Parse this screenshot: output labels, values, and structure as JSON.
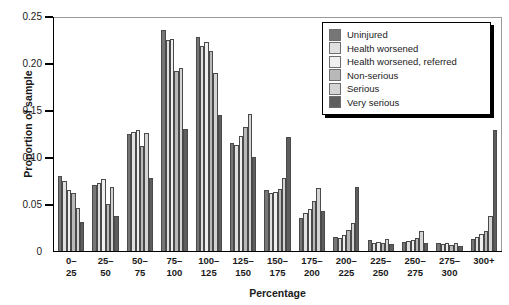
{
  "chart_data": {
    "type": "bar",
    "title": "",
    "xlabel": "Percentage",
    "ylabel": "Proportion of sample",
    "ylim": [
      0,
      0.25
    ],
    "ytick_values": [
      0,
      0.05,
      0.1,
      0.15,
      0.2,
      0.25
    ],
    "ytick_labels": [
      "0",
      "0.05",
      "0.10",
      "0.15",
      "0.20",
      "0.25"
    ],
    "grid": false,
    "legend_position": "top-right",
    "categories": [
      "0–25",
      "25–50",
      "50–75",
      "75–100",
      "100–125",
      "125–150",
      "150–175",
      "175–200",
      "200–225",
      "225–250",
      "250–275",
      "275–300",
      "300+"
    ],
    "category_lines": [
      [
        "0–",
        "25"
      ],
      [
        "25–",
        "50"
      ],
      [
        "50–",
        "75"
      ],
      [
        "75–",
        "100"
      ],
      [
        "100–",
        "125"
      ],
      [
        "125–",
        "150"
      ],
      [
        "150–",
        "175"
      ],
      [
        "175–",
        "200"
      ],
      [
        "200–",
        "225"
      ],
      [
        "225–",
        "250"
      ],
      [
        "250–",
        "275"
      ],
      [
        "275–",
        "300"
      ],
      [
        "300+",
        ""
      ]
    ],
    "series": [
      {
        "name": "Uninjured",
        "color": "#767676",
        "values": [
          0.08,
          0.07,
          0.125,
          0.235,
          0.228,
          0.115,
          0.065,
          0.035,
          0.015,
          0.012,
          0.01,
          0.008,
          0.013
        ]
      },
      {
        "name": "Health worsened",
        "color": "#e0e0e0",
        "values": [
          0.075,
          0.072,
          0.127,
          0.225,
          0.218,
          0.113,
          0.062,
          0.04,
          0.014,
          0.009,
          0.011,
          0.007,
          0.015
        ]
      },
      {
        "name": "Health worsened, referred",
        "color": "#efefef",
        "values": [
          0.065,
          0.077,
          0.129,
          0.226,
          0.222,
          0.122,
          0.063,
          0.045,
          0.017,
          0.01,
          0.012,
          0.009,
          0.018
        ]
      },
      {
        "name": "Non-serious",
        "color": "#b9b9b9",
        "values": [
          0.062,
          0.05,
          0.112,
          0.192,
          0.213,
          0.132,
          0.066,
          0.053,
          0.022,
          0.009,
          0.014,
          0.006,
          0.021
        ]
      },
      {
        "name": "Serious",
        "color": "#d4d4d4",
        "values": [
          0.046,
          0.068,
          0.126,
          0.195,
          0.189,
          0.146,
          0.078,
          0.067,
          0.03,
          0.013,
          0.021,
          0.008,
          0.037
        ]
      },
      {
        "name": "Very serious",
        "color": "#5e5e5e",
        "values": [
          0.031,
          0.037,
          0.078,
          0.13,
          0.145,
          0.1,
          0.121,
          0.043,
          0.068,
          0.007,
          0.009,
          0.005,
          0.129
        ]
      }
    ]
  },
  "legend": {
    "items": [
      "Uninjured",
      "Health worsened",
      "Health worsened, referred",
      "Non-serious",
      "Serious",
      "Very serious"
    ]
  }
}
